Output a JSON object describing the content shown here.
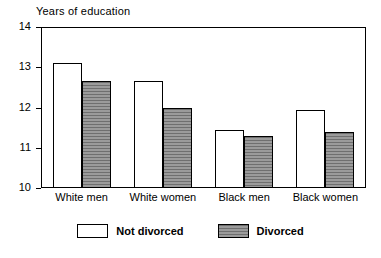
{
  "chart_data": {
    "type": "bar",
    "title": "Years of education",
    "xlabel": "",
    "ylabel": "",
    "ylim": [
      10,
      14
    ],
    "yticks": [
      10,
      11,
      12,
      13,
      14
    ],
    "ytick_labels": [
      "10",
      "11",
      "12",
      "13",
      "14"
    ],
    "grid": false,
    "legend_position": "bottom",
    "categories": [
      "White men",
      "White women",
      "Black men",
      "Black women"
    ],
    "series": [
      {
        "name": "Not divorced",
        "color": "#ffffff",
        "values": [
          13.1,
          12.65,
          11.45,
          11.95
        ]
      },
      {
        "name": "Divorced",
        "color": "#8a8a8a",
        "values": [
          12.65,
          12.0,
          11.3,
          11.4
        ]
      }
    ]
  }
}
